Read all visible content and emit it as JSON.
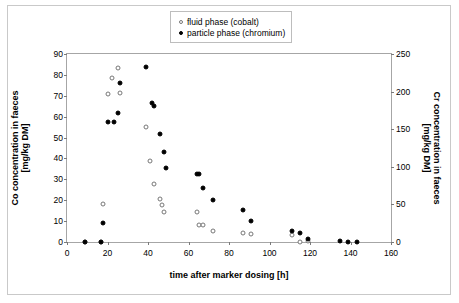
{
  "chart_data": {
    "type": "scatter",
    "title": "Animal 1",
    "xlabel": "time after marker dosing [h]",
    "ylabel": "Co concentration in faeces [mg/kg DM]",
    "ylabel_line1": "Co concentration in faeces",
    "ylabel_line2": "[mg/kg DM]",
    "y2label": "Cr concentration in faeces [mg/kg DM]",
    "y2label_line1": "Cr concentration in faeces",
    "y2label_line2": "[mg/kg DM]",
    "xlim": [
      0,
      160
    ],
    "ylim": [
      0,
      90
    ],
    "y2lim": [
      0,
      250
    ],
    "xticks": [
      0,
      20,
      40,
      60,
      80,
      100,
      120,
      140,
      160
    ],
    "yticks": [
      0,
      10,
      20,
      30,
      40,
      50,
      60,
      70,
      80,
      90
    ],
    "y2ticks": [
      0,
      50,
      100,
      150,
      200,
      250
    ],
    "grid": false,
    "legend_position": "upper-right-inside",
    "series": [
      {
        "name": "fluid phase (cobalt)",
        "marker": "open-circle",
        "axis": "left",
        "color": "#777777",
        "points": [
          {
            "x": 9,
            "y": 0.0
          },
          {
            "x": 17,
            "y": 0.2
          },
          {
            "x": 18,
            "y": 18.3
          },
          {
            "x": 20,
            "y": 71.0
          },
          {
            "x": 22,
            "y": 78.4
          },
          {
            "x": 25,
            "y": 83.4
          },
          {
            "x": 26,
            "y": 71.3
          },
          {
            "x": 39,
            "y": 55.2
          },
          {
            "x": 41,
            "y": 38.8
          },
          {
            "x": 43,
            "y": 28.0
          },
          {
            "x": 46,
            "y": 20.8
          },
          {
            "x": 47,
            "y": 17.6
          },
          {
            "x": 48,
            "y": 14.2
          },
          {
            "x": 64,
            "y": 14.2
          },
          {
            "x": 65,
            "y": 8.2
          },
          {
            "x": 67,
            "y": 8.2
          },
          {
            "x": 72,
            "y": 5.4
          },
          {
            "x": 87,
            "y": 4.4
          },
          {
            "x": 91,
            "y": 3.6
          },
          {
            "x": 111,
            "y": 3.2
          },
          {
            "x": 115,
            "y": 0.2
          },
          {
            "x": 119,
            "y": 0.3
          }
        ]
      },
      {
        "name": "particle phase (chromium)",
        "marker": "filled-circle",
        "axis": "right",
        "color": "#000000",
        "points": [
          {
            "x": 9,
            "y": 0
          },
          {
            "x": 17,
            "y": 0
          },
          {
            "x": 18,
            "y": 25
          },
          {
            "x": 20,
            "y": 159
          },
          {
            "x": 23,
            "y": 160
          },
          {
            "x": 25,
            "y": 172
          },
          {
            "x": 26,
            "y": 212
          },
          {
            "x": 39,
            "y": 233
          },
          {
            "x": 42,
            "y": 185
          },
          {
            "x": 43,
            "y": 181
          },
          {
            "x": 46,
            "y": 144
          },
          {
            "x": 48,
            "y": 120
          },
          {
            "x": 49,
            "y": 99
          },
          {
            "x": 64,
            "y": 91
          },
          {
            "x": 65,
            "y": 91
          },
          {
            "x": 67,
            "y": 72
          },
          {
            "x": 72,
            "y": 56
          },
          {
            "x": 87,
            "y": 42
          },
          {
            "x": 91,
            "y": 28
          },
          {
            "x": 111,
            "y": 14
          },
          {
            "x": 115,
            "y": 12
          },
          {
            "x": 119,
            "y": 4
          },
          {
            "x": 135,
            "y": 1
          },
          {
            "x": 139,
            "y": 0.5
          },
          {
            "x": 143,
            "y": 0.5
          }
        ]
      }
    ]
  }
}
